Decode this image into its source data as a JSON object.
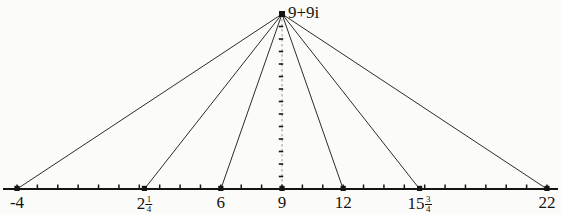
{
  "figure": {
    "kind": "geometric-construction",
    "background_color": "#fbfbfa",
    "ink_color": "#16140f",
    "apex": {
      "label": "9+9i",
      "real": 9,
      "imag": 9
    },
    "axis": {
      "orientation": "horizontal",
      "min": -4,
      "max": 22,
      "tick_step": 1,
      "labeled_ticks": [
        {
          "label_text": "-4",
          "value": -4,
          "whole": "-4",
          "numerator": "",
          "denominator": "",
          "has_marker": true
        },
        {
          "label_text": "2 1/4",
          "value": 2.25,
          "whole": "2",
          "numerator": "1",
          "denominator": "4",
          "has_marker": true
        },
        {
          "label_text": "6",
          "value": 6,
          "whole": "6",
          "numerator": "",
          "denominator": "",
          "has_marker": true
        },
        {
          "label_text": "9",
          "value": 9,
          "whole": "9",
          "numerator": "",
          "denominator": "",
          "has_marker": true
        },
        {
          "label_text": "12",
          "value": 12,
          "whole": "12",
          "numerator": "",
          "denominator": "",
          "has_marker": true
        },
        {
          "label_text": "15 3/4",
          "value": 15.75,
          "whole": "15",
          "numerator": "3",
          "denominator": "4",
          "has_marker": true
        },
        {
          "label_text": "22",
          "value": 22,
          "whole": "22",
          "numerator": "",
          "denominator": "",
          "has_marker": true
        }
      ]
    },
    "vertical_line": {
      "at_value": 9,
      "style": "dashed-with-ticks",
      "tick_count": 13
    },
    "rays": [
      {
        "from": "9+9i",
        "to_value": -4
      },
      {
        "from": "9+9i",
        "to_value": 2.25
      },
      {
        "from": "9+9i",
        "to_value": 6
      },
      {
        "from": "9+9i",
        "to_value": 9
      },
      {
        "from": "9+9i",
        "to_value": 12
      },
      {
        "from": "9+9i",
        "to_value": 15.75
      },
      {
        "from": "9+9i",
        "to_value": 22
      }
    ]
  }
}
